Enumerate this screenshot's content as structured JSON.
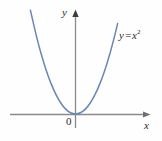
{
  "figure": {
    "kind": "cartesian-plot",
    "width": 162,
    "height": 141,
    "background_color": "#fefefe",
    "axis_color": "#8a8a8a",
    "curve_color": "#6d86b0",
    "text_color": "#2b2b2b",
    "labels": {
      "y_axis": "y",
      "x_axis": "x",
      "origin": "0",
      "curve_var": "y",
      "curve_op": "=",
      "curve_base": "x",
      "curve_exponent": "2",
      "curve_full": "y = x²"
    }
  },
  "chart_data": {
    "type": "line",
    "title": "",
    "subtitle": "",
    "xlabel": "x",
    "ylabel": "y",
    "grid": false,
    "legend": null,
    "annotations": [
      {
        "text": "y = x²",
        "x": 2.05,
        "y": 4.2
      },
      {
        "text": "0",
        "x": -0.25,
        "y": -0.45
      }
    ],
    "xlim": [
      -2.7,
      3.1
    ],
    "ylim": [
      -0.6,
      5.4
    ],
    "axis_origin": {
      "x": 0,
      "y": 0
    },
    "series": [
      {
        "name": "y = x²",
        "equation": "y = x^2",
        "color": "#6d86b0",
        "x": [
          -2.3,
          -2.0,
          -1.75,
          -1.5,
          -1.25,
          -1.0,
          -0.75,
          -0.5,
          -0.25,
          0.0,
          0.25,
          0.5,
          0.75,
          1.0,
          1.25,
          1.5,
          1.75,
          2.0,
          2.15
        ],
        "values": [
          5.29,
          4.0,
          3.0625,
          2.25,
          1.5625,
          1.0,
          0.5625,
          0.25,
          0.0625,
          0.0,
          0.0625,
          0.25,
          0.5625,
          1.0,
          1.5625,
          2.25,
          3.0625,
          4.0,
          4.6225
        ]
      }
    ]
  }
}
